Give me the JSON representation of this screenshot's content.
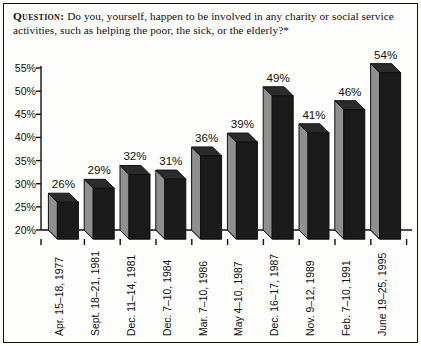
{
  "question": {
    "label": "Question:",
    "text": "Do you, yourself, happen to be involved in any charity or social service activities, such as helping the poor, the sick, or the elderly?*"
  },
  "colors": {
    "bar_front": "#1a1a1a",
    "bar_side": "#8f8f8f",
    "bar_top": "#2b2b2b",
    "bar_base": "#9a9a9a",
    "axis": "#111111",
    "frame": "#111111",
    "background": "#fdfdfb"
  },
  "chart_data": {
    "type": "bar",
    "title": "",
    "subtitle": "",
    "xlabel": "",
    "ylabel": "",
    "grid": false,
    "legend": "none",
    "three_d": true,
    "ylim": [
      20,
      55
    ],
    "ytick_labels": [
      "55%",
      "50%",
      "45%",
      "40%",
      "35%",
      "30%",
      "25%",
      "20%"
    ],
    "ytick_values": [
      55,
      50,
      45,
      40,
      35,
      30,
      25,
      20
    ],
    "categories": [
      "Apr. 15–18, 1977",
      "Sept. 18–21, 1981",
      "Dec. 11–14, 1981",
      "Dec. 7–10, 1984",
      "Mar. 7–10, 1986",
      "May 4–10, 1987",
      "Dec. 16–17, 1987",
      "Nov. 9–12, 1989",
      "Feb. 7–10, 1991",
      "June 19–25, 1995"
    ],
    "values": [
      26,
      29,
      32,
      31,
      36,
      39,
      49,
      41,
      46,
      54
    ],
    "value_labels": [
      "26%",
      "29%",
      "32%",
      "31%",
      "36%",
      "39%",
      "49%",
      "41%",
      "46%",
      "54%"
    ]
  }
}
